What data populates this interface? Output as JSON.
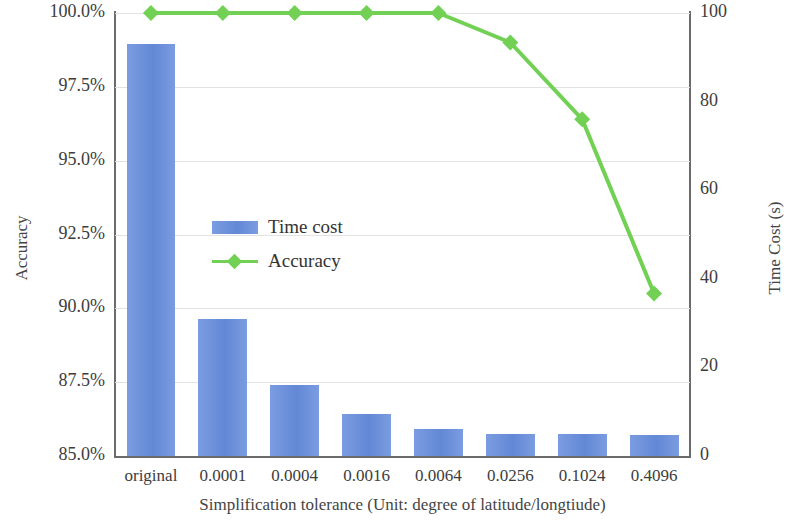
{
  "chart_data": {
    "type": "bar",
    "title": "",
    "xlabel": "Simplification tolerance (Unit: degree of latitude/longtiude)",
    "categories": [
      "original",
      "0.0001",
      "0.0004",
      "0.0016",
      "0.0064",
      "0.0256",
      "0.1024",
      "0.4096"
    ],
    "left_axis": {
      "label": "Accuracy",
      "ticks": [
        "85.0%",
        "87.5%",
        "90.0%",
        "92.5%",
        "95.0%",
        "97.5%",
        "100.0%"
      ],
      "tick_values": [
        85.0,
        87.5,
        90.0,
        92.5,
        95.0,
        97.5,
        100.0
      ],
      "ylim": [
        85.0,
        100.0
      ]
    },
    "right_axis": {
      "label": "Time Cost (s)",
      "ticks": [
        "0",
        "20",
        "40",
        "60",
        "80",
        "100"
      ],
      "tick_values": [
        0,
        20,
        40,
        60,
        80,
        100
      ],
      "ylim": [
        0,
        100
      ]
    },
    "grid": true,
    "legend_position": "center-left-inside",
    "series": [
      {
        "name": "Time cost",
        "type": "bar",
        "axis": "right",
        "unit": "s",
        "color": "#6a8fd8",
        "values": [
          93,
          31,
          16,
          9.5,
          6,
          5,
          5,
          4.8
        ]
      },
      {
        "name": "Accuracy",
        "type": "line",
        "axis": "left",
        "unit": "%",
        "color": "#72d155",
        "marker": "diamond",
        "values": [
          100.0,
          100.0,
          100.0,
          100.0,
          100.0,
          99.0,
          96.4,
          90.5
        ]
      }
    ]
  },
  "legend": {
    "items": [
      {
        "label": "Time cost",
        "swatch": "bar"
      },
      {
        "label": "Accuracy",
        "swatch": "line"
      }
    ]
  }
}
